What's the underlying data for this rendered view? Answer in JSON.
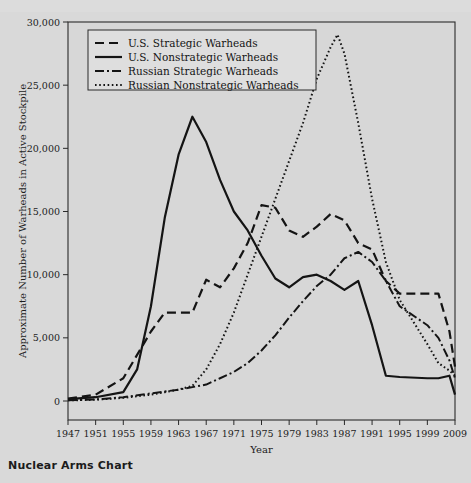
{
  "caption": "Nuclear Arms Chart",
  "chart_data": {
    "type": "line",
    "title": "",
    "xlabel": "Year",
    "ylabel": "Approximate Number of Warheads in Active Stockpile",
    "xlim": [
      1947,
      2009
    ],
    "ylim": [
      0,
      30000
    ],
    "grid": false,
    "legend_position": "top-left",
    "xticks": [
      1947,
      1951,
      1955,
      1959,
      1963,
      1967,
      1971,
      1975,
      1979,
      1983,
      1987,
      1991,
      1995,
      1999,
      2009
    ],
    "xticklabels": [
      "1947",
      "1951",
      "1955",
      "1959",
      "1963",
      "1967",
      "1971",
      "1975",
      "1979",
      "1983",
      "1987",
      "1991",
      "1995",
      "1999",
      "2009"
    ],
    "yticks": [
      0,
      5000,
      10000,
      15000,
      20000,
      25000,
      30000
    ],
    "yticklabels": [
      "0",
      "5,000",
      "10,000",
      "15,000",
      "20,000",
      "25,000",
      "30,000"
    ],
    "series": [
      {
        "name": "U.S. Strategic Warheads",
        "style": "dashed",
        "x": [
          1947,
          1951,
          1955,
          1959,
          1961,
          1963,
          1965,
          1967,
          1969,
          1971,
          1973,
          1975,
          1977,
          1979,
          1981,
          1983,
          1985,
          1987,
          1989,
          1991,
          1993,
          1995,
          1999,
          2003,
          2007,
          2009
        ],
        "y": [
          200,
          500,
          1800,
          5500,
          7000,
          7000,
          7000,
          9600,
          9000,
          10500,
          12500,
          15500,
          15300,
          13500,
          13000,
          13800,
          14800,
          14300,
          12500,
          12000,
          9500,
          8500,
          8500,
          8500,
          5500,
          2700
        ]
      },
      {
        "name": "U.S. Nonstrategic Warheads",
        "style": "solid",
        "x": [
          1947,
          1951,
          1955,
          1957,
          1959,
          1961,
          1963,
          1965,
          1967,
          1969,
          1971,
          1973,
          1975,
          1977,
          1979,
          1981,
          1983,
          1985,
          1987,
          1989,
          1991,
          1993,
          1995,
          1999,
          2003,
          2007,
          2009
        ],
        "y": [
          150,
          300,
          700,
          2500,
          7500,
          14500,
          19500,
          22500,
          20500,
          17500,
          15000,
          13500,
          11500,
          9700,
          9000,
          9800,
          10000,
          9500,
          8800,
          9500,
          6000,
          2000,
          1900,
          1800,
          1800,
          2000,
          500
        ]
      },
      {
        "name": "Russian Strategic Warheads",
        "style": "dashdot",
        "x": [
          1947,
          1951,
          1955,
          1959,
          1963,
          1967,
          1969,
          1971,
          1973,
          1975,
          1977,
          1979,
          1981,
          1983,
          1985,
          1987,
          1989,
          1991,
          1993,
          1995,
          1999,
          2003,
          2007,
          2009
        ],
        "y": [
          50,
          120,
          300,
          600,
          900,
          1300,
          1800,
          2300,
          3000,
          4000,
          5200,
          6600,
          7900,
          9100,
          10000,
          11300,
          11800,
          11000,
          9500,
          7500,
          6000,
          5000,
          3200,
          1800
        ]
      },
      {
        "name": "Russian Nonstrategic Warheads",
        "style": "dotted",
        "x": [
          1947,
          1951,
          1955,
          1959,
          1961,
          1963,
          1965,
          1967,
          1969,
          1971,
          1973,
          1975,
          1977,
          1979,
          1981,
          1983,
          1985,
          1986,
          1987,
          1989,
          1991,
          1993,
          1995,
          1999,
          2003,
          2007,
          2009
        ],
        "y": [
          50,
          100,
          250,
          500,
          700,
          900,
          1200,
          2500,
          4500,
          7000,
          10000,
          13000,
          16000,
          19000,
          22000,
          25500,
          28000,
          29000,
          27500,
          22000,
          16000,
          11000,
          8000,
          4500,
          3000,
          2400,
          2000
        ]
      }
    ]
  },
  "legend": {
    "items": [
      {
        "label": "U.S. Strategic Warheads",
        "style": "dashed"
      },
      {
        "label": "U.S. Nonstrategic Warheads",
        "style": "solid"
      },
      {
        "label": "Russian Strategic Warheads",
        "style": "dashdot"
      },
      {
        "label": "Russian Nonstrategic Warheads",
        "style": "dotted"
      }
    ]
  },
  "colors": {
    "background": "#d9d9d9",
    "plot_background": "#d7d7d7",
    "line": "#141414",
    "axis": "#2a2a2a"
  }
}
